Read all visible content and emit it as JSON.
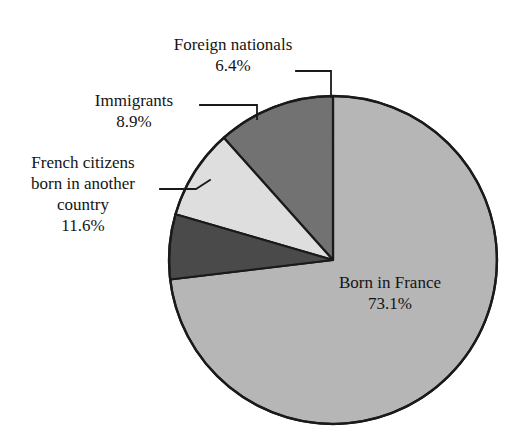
{
  "chart_data": {
    "type": "pie",
    "title": "",
    "subtitle": "",
    "xlabel": "",
    "ylabel": "",
    "legend_position": "none",
    "grid": false,
    "units": "percent",
    "total": 100.0,
    "start_angle_deg": 0,
    "direction": "clockwise",
    "categories": [
      "Born in France",
      "Foreign nationals",
      "Immigrants",
      "French citizens born in another country"
    ],
    "values": [
      73.1,
      6.4,
      8.9,
      11.6
    ],
    "slices": [
      {
        "label": "Born in France",
        "value": 73.1,
        "value_text": "73.1%",
        "color": "#b6b6b6",
        "label_placement": "inside"
      },
      {
        "label": "Foreign nationals",
        "value": 6.4,
        "value_text": "6.4%",
        "color": "#4a4a4a",
        "label_placement": "outside-callout"
      },
      {
        "label": "Immigrants",
        "value": 8.9,
        "value_text": "8.9%",
        "color": "#dedede",
        "label_placement": "outside-callout"
      },
      {
        "label": "French citizens born in another country",
        "value": 11.6,
        "value_text": "11.6%",
        "color": "#727272",
        "label_placement": "outside-callout"
      }
    ]
  },
  "labels": {
    "foreign": {
      "title": "Foreign nationals",
      "pct": "6.4%"
    },
    "immigrants": {
      "title": "Immigrants",
      "pct": "8.9%"
    },
    "french_citizens": {
      "line1": "French citizens",
      "line2": "born in another",
      "line3": "country",
      "pct": "11.6%"
    },
    "born_in_france": {
      "title": "Born in France",
      "pct": "73.1%"
    }
  },
  "style": {
    "background": "#ffffff",
    "outline": "#1a1a1a",
    "leader_line": "#1a1a1a",
    "text": "#141414"
  }
}
